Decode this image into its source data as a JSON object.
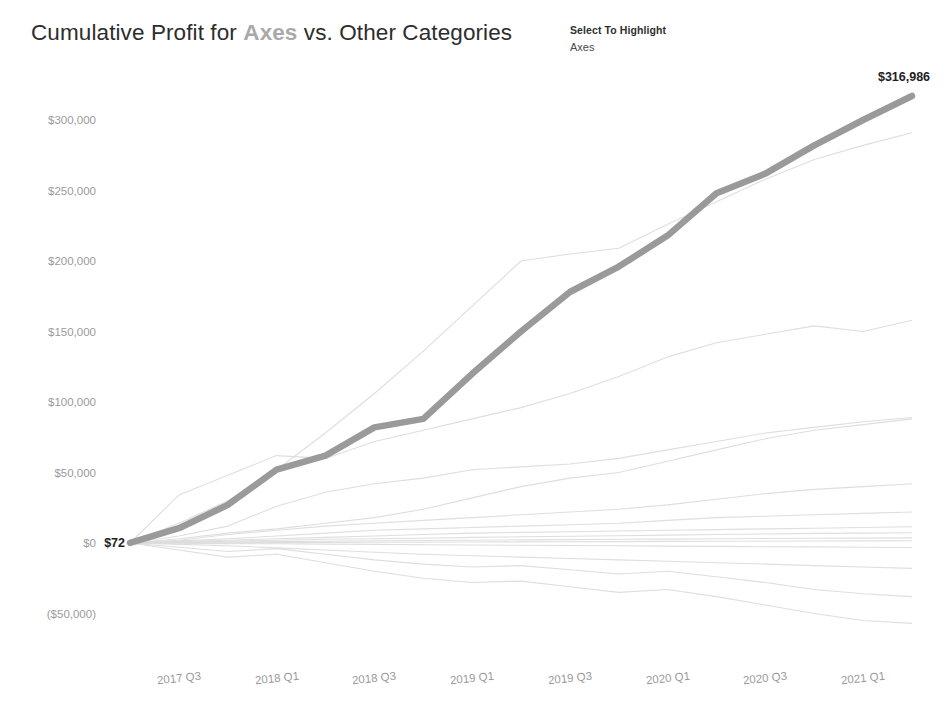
{
  "header": {
    "title_prefix": "Cumulative Profit for ",
    "title_highlight": "Axes",
    "title_suffix": " vs. Other Categories",
    "legend_title": "Select To Highlight",
    "legend_items": [
      {
        "label": "Axes"
      }
    ]
  },
  "colors": {
    "highlight_line": "#9a9a9a",
    "background_line": "#dcdcdc",
    "axis_text": "#9b9b9b",
    "title_text": "#2d2d2d",
    "title_highlight": "#a9a9a9",
    "label_text": "#1e1e1e",
    "canvas": "#ffffff"
  },
  "labels": {
    "start_value": "$72",
    "end_value": "$316,986"
  },
  "chart_data": {
    "type": "line",
    "title": "Cumulative Profit for Axes vs. Other Categories",
    "xlabel": "",
    "ylabel": "",
    "grid": false,
    "legend_position": "top-right",
    "x": [
      "2017 Q2",
      "2017 Q3",
      "2017 Q4",
      "2018 Q1",
      "2018 Q2",
      "2018 Q3",
      "2018 Q4",
      "2019 Q1",
      "2019 Q2",
      "2019 Q3",
      "2019 Q4",
      "2020 Q1",
      "2020 Q2",
      "2020 Q3",
      "2020 Q4",
      "2021 Q1",
      "2021 Q2"
    ],
    "xtick_labels": [
      "2017 Q3",
      "2018 Q1",
      "2018 Q3",
      "2019 Q1",
      "2019 Q3",
      "2020 Q1",
      "2020 Q3",
      "2021 Q1"
    ],
    "ytick_labels": [
      "$300,000",
      "$250,000",
      "$200,000",
      "$150,000",
      "$100,000",
      "$50,000",
      "$0",
      "($50,000)"
    ],
    "ytick_values": [
      300000,
      250000,
      200000,
      150000,
      100000,
      50000,
      0,
      -50000
    ],
    "ylim": [
      -75000,
      325000
    ],
    "highlighted_series": "Axes",
    "series": [
      {
        "name": "Axes",
        "highlighted": true,
        "values": [
          72,
          10500,
          27000,
          52000,
          62000,
          82000,
          88000,
          120000,
          150000,
          178000,
          196000,
          218000,
          248000,
          262000,
          282000,
          300000,
          316986
        ]
      },
      {
        "name": "Series B",
        "highlighted": false,
        "values": [
          0,
          14000,
          30000,
          52000,
          78000,
          106000,
          136000,
          168000,
          200000,
          205000,
          209000,
          226000,
          242000,
          258000,
          272000,
          282000,
          291000
        ]
      },
      {
        "name": "Series C",
        "highlighted": false,
        "values": [
          0,
          34000,
          48000,
          62000,
          60000,
          72000,
          80000,
          88000,
          96000,
          106000,
          118000,
          132000,
          142000,
          148000,
          154000,
          150000,
          158000
        ]
      },
      {
        "name": "Series D",
        "highlighted": false,
        "values": [
          0,
          5000,
          12000,
          26000,
          36000,
          42000,
          46000,
          52000,
          54000,
          56000,
          60000,
          66000,
          72000,
          78000,
          82000,
          86000,
          89000
        ]
      },
      {
        "name": "Series E",
        "highlighted": false,
        "values": [
          0,
          3000,
          7000,
          10000,
          14000,
          18000,
          24000,
          32000,
          40000,
          46000,
          50000,
          58000,
          66000,
          74000,
          80000,
          84000,
          88000
        ]
      },
      {
        "name": "Series F",
        "highlighted": false,
        "values": [
          0,
          2000,
          6000,
          9000,
          12000,
          14000,
          16000,
          18000,
          20000,
          22000,
          24000,
          27000,
          31000,
          35000,
          38000,
          40000,
          42000
        ]
      },
      {
        "name": "Series G",
        "highlighted": false,
        "values": [
          0,
          1500,
          3000,
          5000,
          7000,
          9000,
          10000,
          11000,
          12000,
          13000,
          14000,
          16000,
          18000,
          19000,
          20000,
          21000,
          22000
        ]
      },
      {
        "name": "Series H",
        "highlighted": false,
        "values": [
          0,
          1000,
          2000,
          3000,
          4000,
          5000,
          6000,
          7000,
          7500,
          8000,
          8500,
          9000,
          9500,
          10000,
          10500,
          11000,
          11500
        ]
      },
      {
        "name": "Series I",
        "highlighted": false,
        "values": [
          0,
          600,
          1200,
          2000,
          2600,
          3000,
          3400,
          4000,
          4400,
          4800,
          5200,
          5600,
          6000,
          6400,
          6800,
          7000,
          7200
        ]
      },
      {
        "name": "Series J",
        "highlighted": false,
        "values": [
          0,
          300,
          700,
          1000,
          1300,
          1600,
          1800,
          2000,
          2200,
          2400,
          2600,
          2800,
          3000,
          3200,
          3400,
          3500,
          3600
        ]
      },
      {
        "name": "Series K",
        "highlighted": false,
        "values": [
          0,
          100,
          200,
          300,
          400,
          500,
          600,
          700,
          800,
          900,
          1000,
          1100,
          1200,
          1300,
          1400,
          1500,
          1600
        ]
      },
      {
        "name": "Series L",
        "highlighted": false,
        "values": [
          0,
          -200,
          -400,
          -600,
          -800,
          -1000,
          -1200,
          -1400,
          -1600,
          -1800,
          -2000,
          -2200,
          -2400,
          -2600,
          -2800,
          -3000,
          -3200
        ]
      },
      {
        "name": "Series M",
        "highlighted": false,
        "values": [
          0,
          -1000,
          -2000,
          -3500,
          -5000,
          -6500,
          -8000,
          -9000,
          -10000,
          -11000,
          -12000,
          -13000,
          -14000,
          -15000,
          -16000,
          -17000,
          -18000
        ]
      },
      {
        "name": "Series N",
        "highlighted": false,
        "values": [
          0,
          -3000,
          -6000,
          -4000,
          -8000,
          -12000,
          -15000,
          -17000,
          -16000,
          -19000,
          -22000,
          -20000,
          -24000,
          -28000,
          -33000,
          -36000,
          -38000
        ]
      },
      {
        "name": "Series O",
        "highlighted": false,
        "values": [
          0,
          -5000,
          -10000,
          -8000,
          -14000,
          -20000,
          -25000,
          -28000,
          -27000,
          -31000,
          -35000,
          -33000,
          -38000,
          -44000,
          -50000,
          -55000,
          -57000
        ]
      }
    ]
  }
}
